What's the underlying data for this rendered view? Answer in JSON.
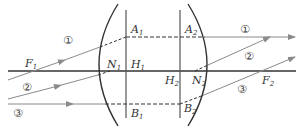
{
  "diagram": {
    "type": "thick-lens-ray-construction",
    "colors": {
      "axis": "#333333",
      "lens": "#333333",
      "planes": "#555555",
      "rays": "#8a8a8a",
      "dashed": "#333333"
    },
    "labels": {
      "F1": {
        "main": "F",
        "sub": "1"
      },
      "F2": {
        "main": "F",
        "sub": "2"
      },
      "N1": {
        "main": "N",
        "sub": "1"
      },
      "N2": {
        "main": "N",
        "sub": "2"
      },
      "H1": {
        "main": "H",
        "sub": "1"
      },
      "H2": {
        "main": "H",
        "sub": "2"
      },
      "A1": {
        "main": "A",
        "sub": "1"
      },
      "A2": {
        "main": "A",
        "sub": "2"
      },
      "B1": {
        "main": "B",
        "sub": "1"
      },
      "B2": {
        "main": "B",
        "sub": "2"
      }
    },
    "rays": [
      {
        "id": "1",
        "label": "①"
      },
      {
        "id": "2",
        "label": "②"
      },
      {
        "id": "3",
        "label": "③"
      }
    ]
  }
}
